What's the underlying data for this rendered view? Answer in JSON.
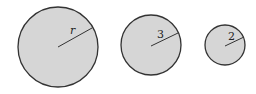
{
  "diagram": {
    "fill_color": "#d6d6d6",
    "stroke_color": "#333333",
    "circles": [
      {
        "label": "r",
        "cx": 58,
        "cy": 47,
        "r": 40,
        "lx": 72,
        "ly": 33,
        "ex": 92,
        "ey": 28
      },
      {
        "label": "3",
        "cx": 151,
        "cy": 45,
        "r": 30,
        "lx": 160,
        "ly": 38,
        "ex": 178,
        "ey": 33
      },
      {
        "label": "2",
        "cx": 225,
        "cy": 45,
        "r": 20,
        "lx": 230,
        "ly": 40,
        "ex": 243,
        "ey": 37
      }
    ]
  }
}
